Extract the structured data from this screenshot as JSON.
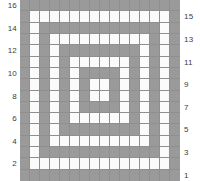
{
  "figure": {
    "kind": "grid-plot",
    "colors": {
      "filled": "#9a9a9a",
      "empty": "#fbfbfb",
      "gridline": "#8f8f8f",
      "label": "#3c3c3c"
    }
  },
  "chart_data": {
    "type": "heatmap",
    "title": "",
    "xlabel": "",
    "ylabel": "",
    "rows": 16,
    "cols": 16,
    "grid": true,
    "legend": null,
    "value_legend": {
      "1": "filled gray cell",
      "0": "empty white cell"
    },
    "values": [
      [
        1,
        1,
        1,
        1,
        1,
        1,
        1,
        1,
        1,
        1,
        1,
        1,
        1,
        1,
        1,
        1
      ],
      [
        1,
        0,
        0,
        0,
        0,
        0,
        0,
        0,
        0,
        0,
        0,
        0,
        0,
        0,
        0,
        1
      ],
      [
        1,
        0,
        1,
        1,
        1,
        1,
        1,
        1,
        1,
        1,
        1,
        1,
        1,
        1,
        0,
        1
      ],
      [
        1,
        0,
        1,
        0,
        0,
        0,
        0,
        0,
        0,
        0,
        0,
        0,
        0,
        1,
        0,
        1
      ],
      [
        1,
        0,
        1,
        0,
        1,
        1,
        1,
        1,
        1,
        1,
        1,
        1,
        0,
        1,
        0,
        1
      ],
      [
        1,
        0,
        1,
        0,
        1,
        0,
        0,
        0,
        0,
        0,
        0,
        1,
        0,
        1,
        0,
        1
      ],
      [
        1,
        0,
        1,
        0,
        1,
        0,
        1,
        1,
        1,
        1,
        0,
        1,
        0,
        1,
        0,
        1
      ],
      [
        1,
        0,
        1,
        0,
        1,
        0,
        1,
        0,
        0,
        1,
        0,
        1,
        0,
        1,
        0,
        1
      ],
      [
        1,
        0,
        1,
        0,
        1,
        0,
        1,
        0,
        0,
        1,
        0,
        1,
        0,
        1,
        0,
        1
      ],
      [
        1,
        0,
        1,
        0,
        1,
        0,
        1,
        1,
        1,
        1,
        0,
        1,
        0,
        1,
        0,
        1
      ],
      [
        1,
        0,
        1,
        0,
        1,
        0,
        0,
        0,
        0,
        0,
        0,
        1,
        0,
        1,
        0,
        1
      ],
      [
        1,
        0,
        1,
        0,
        1,
        1,
        1,
        1,
        1,
        1,
        1,
        1,
        0,
        1,
        0,
        1
      ],
      [
        1,
        0,
        1,
        0,
        0,
        0,
        0,
        0,
        0,
        0,
        0,
        0,
        0,
        1,
        0,
        1
      ],
      [
        1,
        0,
        1,
        1,
        1,
        1,
        1,
        1,
        1,
        1,
        1,
        1,
        1,
        1,
        0,
        1
      ],
      [
        1,
        0,
        0,
        0,
        0,
        0,
        0,
        0,
        0,
        0,
        0,
        0,
        0,
        0,
        0,
        1
      ],
      [
        1,
        1,
        1,
        1,
        1,
        1,
        1,
        1,
        1,
        1,
        1,
        1,
        1,
        1,
        1,
        1
      ]
    ],
    "y_axis_left": {
      "position": "left",
      "ticks": [
        16,
        14,
        12,
        10,
        8,
        6,
        4,
        2
      ],
      "tick_rows_from_top": [
        1,
        3,
        5,
        7,
        9,
        11,
        13,
        15
      ]
    },
    "y_axis_right": {
      "position": "right",
      "ticks": [
        15,
        13,
        11,
        9,
        7,
        5,
        3,
        1
      ],
      "tick_rows_from_top": [
        2,
        4,
        6,
        8,
        10,
        12,
        14,
        16
      ]
    }
  }
}
